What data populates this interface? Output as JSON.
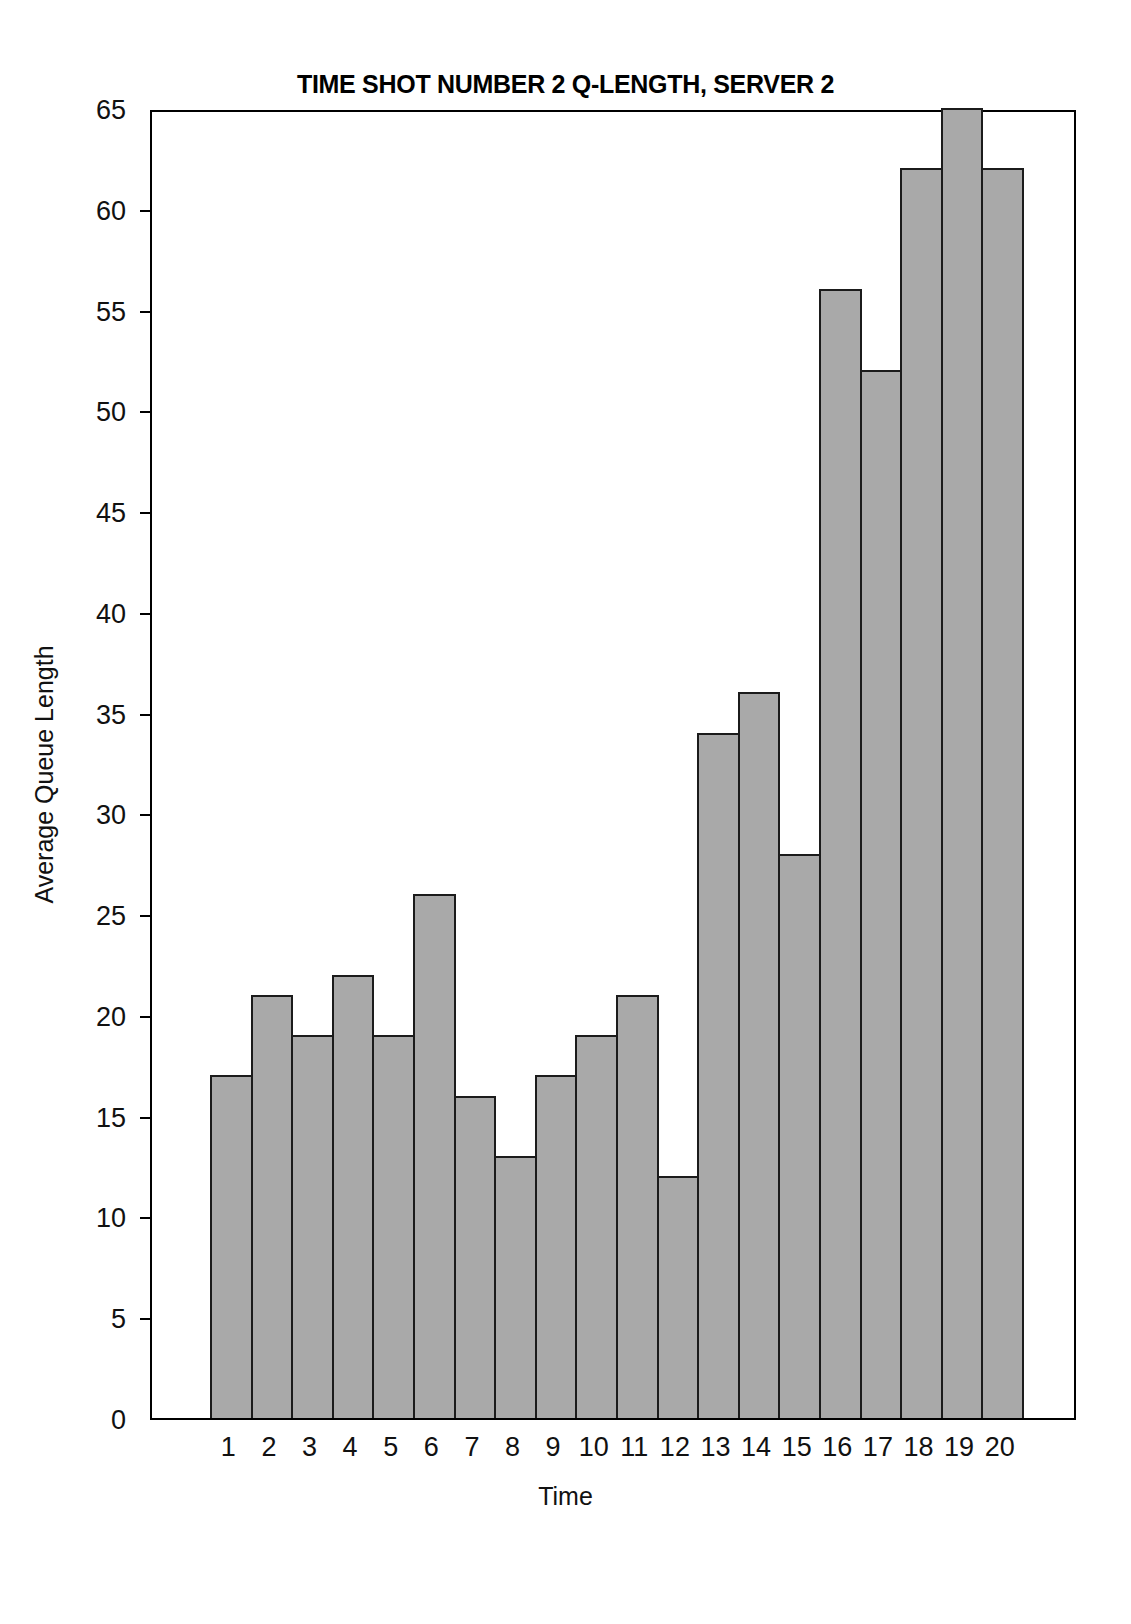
{
  "chart_data": {
    "type": "bar",
    "title": "TIME SHOT NUMBER 2 Q-LENGTH, SERVER 2",
    "xlabel": "Time",
    "ylabel": "Average Queue Length",
    "categories": [
      "1",
      "2",
      "3",
      "4",
      "5",
      "6",
      "7",
      "8",
      "9",
      "10",
      "11",
      "12",
      "13",
      "14",
      "15",
      "16",
      "17",
      "18",
      "19",
      "20"
    ],
    "values": [
      17,
      21,
      19,
      22,
      19,
      26,
      16,
      13,
      17,
      19,
      21,
      12,
      34,
      36,
      28,
      56,
      52,
      62,
      65,
      62
    ],
    "ylim": [
      0,
      65
    ],
    "xlim_note": "categorical bins 1-20, bars contiguous",
    "yticks": [
      0,
      5,
      10,
      15,
      20,
      25,
      30,
      35,
      40,
      45,
      50,
      55,
      60,
      65
    ],
    "ytick_labels": [
      "0",
      "5",
      "10",
      "15",
      "20",
      "25",
      "30",
      "35",
      "40",
      "45",
      "50",
      "55",
      "60",
      "65"
    ],
    "xtick_labels": [
      "1",
      "2",
      "3",
      "4",
      "5",
      "6",
      "7",
      "8",
      "9",
      "10",
      "11",
      "12",
      "13",
      "14",
      "15",
      "16",
      "17",
      "18",
      "19",
      "20"
    ],
    "grid": false,
    "legend": null,
    "bar_fill_color": "#a9a9a9",
    "bar_edge_color": "#1b1b1b",
    "axis_color": "#000000",
    "background_color": "#ffffff"
  },
  "figure": {
    "title": "TIME SHOT NUMBER 2 Q-LENGTH, SERVER 2",
    "x_axis_title": "Time",
    "y_axis_title": "Average Queue Length"
  }
}
